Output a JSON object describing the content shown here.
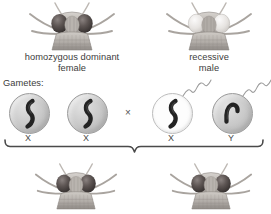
{
  "diagram": {
    "cross_symbol": "×",
    "gametes_label": "Gametes:"
  },
  "parents": [
    {
      "id": "female-parent",
      "label": "homozygous dominant\nfemale",
      "sex": "female",
      "eye_phenotype": "dominant",
      "eye_color": "#4a4240"
    },
    {
      "id": "male-parent",
      "label": "recessive\nmale",
      "sex": "male",
      "eye_phenotype": "recessive",
      "eye_color": "#e6e4e0"
    }
  ],
  "gametes": [
    {
      "id": "egg-x-1",
      "chromosome": "X",
      "label": "X",
      "cell_type": "egg",
      "fill": "gray",
      "has_tail": false,
      "shape": "s-curve"
    },
    {
      "id": "egg-x-2",
      "chromosome": "X",
      "label": "X",
      "cell_type": "egg",
      "fill": "gray",
      "has_tail": false,
      "shape": "s-curve"
    },
    {
      "id": "sperm-x",
      "chromosome": "X",
      "label": "X",
      "cell_type": "sperm",
      "fill": "white",
      "has_tail": true,
      "shape": "s-curve"
    },
    {
      "id": "sperm-y",
      "chromosome": "Y",
      "label": "Y",
      "cell_type": "sperm",
      "fill": "gray",
      "has_tail": true,
      "shape": "hook"
    }
  ],
  "offspring": [
    {
      "id": "offspring-1",
      "eye_phenotype": "dominant",
      "eye_color": "#4a4240"
    },
    {
      "id": "offspring-2",
      "eye_phenotype": "dominant",
      "eye_color": "#4a4240"
    }
  ],
  "colors": {
    "text": "#3c3c3c",
    "brace": "#4a4a4a",
    "cell_gray": "#c6c6c6",
    "cell_white": "#fdfdfd",
    "chromosome": "#2a2a2a",
    "body_gray": "#b9b6b2"
  }
}
